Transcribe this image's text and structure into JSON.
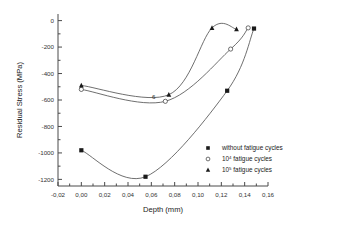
{
  "chart_data": {
    "type": "scatter",
    "title": "",
    "xlabel": "Depth (mm)",
    "ylabel": "Residual Stress (MPa)",
    "xlim": [
      -0.02,
      0.16
    ],
    "ylim": [
      -1250,
      50
    ],
    "xticks": [
      "-0,02",
      "0,00",
      "0,02",
      "0,04",
      "0,06",
      "0,08",
      "0,10",
      "0,12",
      "0,14",
      "0,16"
    ],
    "xtick_values": [
      -0.02,
      0.0,
      0.02,
      0.04,
      0.06,
      0.08,
      0.1,
      0.12,
      0.14,
      0.16
    ],
    "yticks": [
      "0",
      "-200",
      "-400",
      "-600",
      "-800",
      "-1000",
      "-1200"
    ],
    "ytick_values": [
      0,
      -200,
      -400,
      -600,
      -800,
      -1000,
      -1200
    ],
    "grid": false,
    "legend_position": "bottom-right",
    "annotation": "6",
    "series": [
      {
        "name": "without fatigue cycles",
        "marker": "square",
        "x": [
          0.0,
          0.055,
          0.125,
          0.148
        ],
        "y": [
          -980,
          -1180,
          -530,
          -60
        ]
      },
      {
        "name": "10⁴ fatigue cycles",
        "marker": "open-circle",
        "x": [
          0.0,
          0.072,
          0.128,
          0.143
        ],
        "y": [
          -520,
          -610,
          -215,
          -55
        ]
      },
      {
        "name": "10⁵ fatigue cycles",
        "marker": "triangle",
        "x": [
          0.0,
          0.075,
          0.112,
          0.133
        ],
        "y": [
          -490,
          -560,
          -55,
          -65
        ]
      }
    ]
  },
  "legend": {
    "items": [
      {
        "marker": "square",
        "base": "without fatigue cycles",
        "prefix": "",
        "exponent": ""
      },
      {
        "marker": "open-circle",
        "base": " fatigue cycles",
        "prefix": "10",
        "exponent": "4"
      },
      {
        "marker": "triangle",
        "base": " fatigue cycles",
        "prefix": "10",
        "exponent": "5"
      }
    ]
  },
  "colors": {
    "axis": "#4a4a4a",
    "curve": "#555555",
    "marker_fill": "#1a1a1a",
    "background": "#ffffff"
  }
}
